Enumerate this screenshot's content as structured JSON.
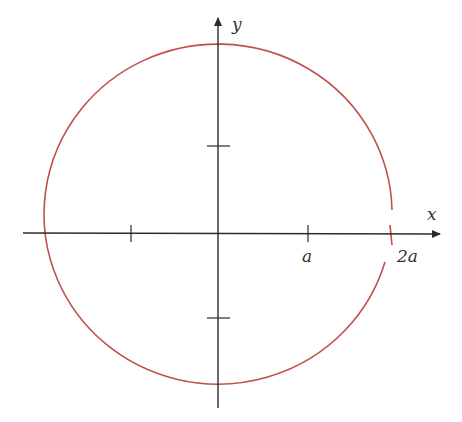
{
  "figure": {
    "type": "polar-curve-sketch",
    "axes": {
      "x_label": "x",
      "y_label": "y",
      "x_tick_labels": [
        "a",
        "2a"
      ],
      "axis_color": "#2b2b2b"
    },
    "curve": {
      "color": "#c0504d",
      "description": "closed near-circular curve passing through x = 2a on the positive x-axis"
    }
  }
}
